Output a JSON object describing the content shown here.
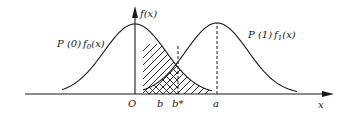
{
  "diagram": {
    "type": "two-gaussian-decision-threshold",
    "colors": {
      "ink": "#1a1a1a",
      "background": "#ffffff"
    },
    "axes": {
      "x_label": "x",
      "y_label": "f(x)",
      "origin_label": "O"
    },
    "curves": [
      {
        "name": "f0",
        "label_prefix": "P (0)",
        "label_func": "f",
        "label_sub": "0",
        "label_arg": "(x)",
        "mean": 0
      },
      {
        "name": "f1",
        "label_prefix": "P (1)",
        "label_func": "f",
        "label_sub": "1",
        "label_arg": "(x)",
        "mean": "a"
      }
    ],
    "x_markers": [
      {
        "label": "b",
        "dashed": false
      },
      {
        "label": "b*",
        "dashed": true
      },
      {
        "label": "a",
        "dashed": true
      }
    ],
    "hatched_regions": [
      {
        "description": "area under f0 to the right of threshold b"
      },
      {
        "description": "area under f1 to the left of threshold b"
      }
    ]
  }
}
